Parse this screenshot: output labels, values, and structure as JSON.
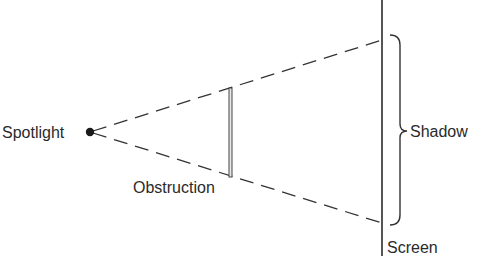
{
  "diagram": {
    "labels": {
      "spotlight": "Spotlight",
      "obstruction": "Obstruction",
      "shadow": "Shadow",
      "screen": "Screen"
    },
    "elements": {
      "light_source": {
        "name": "Spotlight",
        "shape": "filled-dot",
        "x": 90,
        "y": 132
      },
      "obstruction": {
        "name": "Obstruction",
        "shape": "vertical-bar",
        "x": 230,
        "y_top": 88,
        "y_bottom": 177
      },
      "screen": {
        "name": "Screen",
        "shape": "vertical-line",
        "x": 382,
        "y_top": 0,
        "y_bottom": 255
      },
      "rays": [
        {
          "from": "Spotlight",
          "to": "top of shadow on screen",
          "style": "dashed"
        },
        {
          "from": "Spotlight",
          "to": "bottom of shadow on screen",
          "style": "dashed"
        }
      ],
      "shadow_region": {
        "name": "Shadow",
        "marker": "right curly brace",
        "y_top": 37,
        "y_bottom": 225
      }
    },
    "colors": {
      "ink": "#2a2a2a",
      "background": "#ffffff"
    }
  }
}
